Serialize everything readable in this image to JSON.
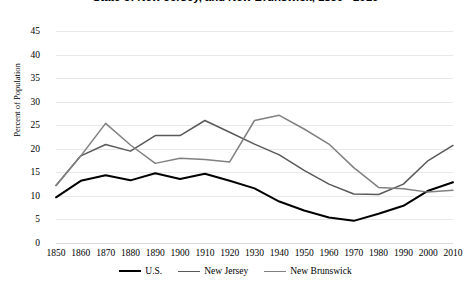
{
  "chart_data": {
    "type": "line",
    "title": "State of New Jersey, and New Brunswick, 1850 - 2010",
    "xlabel": "",
    "ylabel": "Percent of Population",
    "ylim": [
      0,
      45
    ],
    "ytick_step": 5,
    "yticks": [
      "45",
      "40",
      "35",
      "30",
      "25",
      "20",
      "15",
      "10",
      "5",
      "0"
    ],
    "grid": true,
    "legend_position": "bottom",
    "categories": [
      "1850",
      "1860",
      "1870",
      "1880",
      "1890",
      "1900",
      "1910",
      "1920",
      "1930",
      "1940",
      "1950",
      "1960",
      "1970",
      "1980",
      "1990",
      "2000",
      "2010"
    ],
    "series": [
      {
        "name": "U.S.",
        "color": "#000000",
        "values": [
          9.7,
          13.2,
          14.4,
          13.3,
          14.8,
          13.6,
          14.7,
          13.2,
          11.6,
          8.8,
          6.9,
          5.4,
          4.7,
          6.2,
          7.9,
          11.1,
          12.9
        ]
      },
      {
        "name": "New Jersey",
        "color": "#595959",
        "values": [
          12.2,
          18.5,
          20.9,
          19.5,
          22.8,
          22.8,
          26.0,
          23.5,
          21.0,
          18.7,
          15.4,
          12.5,
          10.4,
          10.3,
          12.5,
          17.5,
          20.7
        ]
      },
      {
        "name": "New Brunswick",
        "color": "#808080",
        "values": [
          12.2,
          18.5,
          25.4,
          20.8,
          16.9,
          18.0,
          17.7,
          17.2,
          26.0,
          27.1,
          24.2,
          21.0,
          16.0,
          11.8,
          11.5,
          10.8,
          11.2
        ]
      }
    ],
    "series_overrides": {
      "note_nj": [
        12.2,
        18.5,
        20.9,
        19.5,
        22.8,
        22.8,
        26.0,
        23.5,
        21.0,
        18.7,
        15.4,
        12.5,
        10.4,
        10.3,
        12.5,
        17.5,
        20.7
      ],
      "note_nb": [
        12.2,
        18.5,
        25.4,
        20.8,
        16.9,
        18.0,
        17.7,
        17.2,
        26.0,
        27.1,
        24.2,
        21.0,
        16.0,
        11.8,
        11.5,
        10.8,
        11.2
      ]
    }
  },
  "legend": {
    "items": [
      {
        "label": "U.S.",
        "color": "#000000"
      },
      {
        "label": "New Jersey",
        "color": "#595959"
      },
      {
        "label": "New Brunswick",
        "color": "#808080"
      }
    ]
  }
}
